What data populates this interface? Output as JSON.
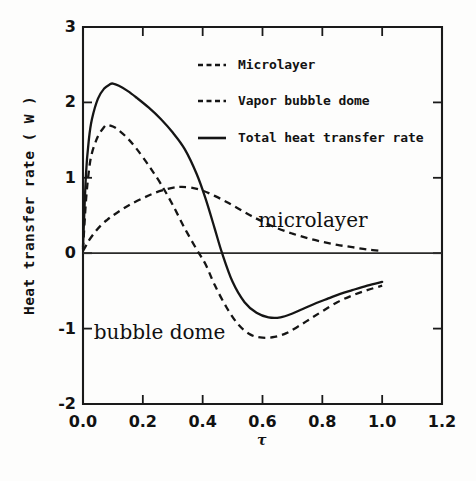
{
  "chart_data": {
    "type": "line",
    "title": "",
    "xlabel": "τ",
    "ylabel": "Heat transfer rate ( W )",
    "xlim": [
      0.0,
      1.2
    ],
    "ylim": [
      -2,
      3
    ],
    "xticks": [
      "0.0",
      "0.2",
      "0.4",
      "0.6",
      "0.8",
      "1.0",
      "1.2"
    ],
    "xtick_values": [
      0.0,
      0.2,
      0.4,
      0.6,
      0.8,
      1.0,
      1.2
    ],
    "yticks": [
      "3",
      "2",
      "1",
      "0",
      "-1",
      "-2"
    ],
    "ytick_values": [
      3,
      2,
      1,
      0,
      -1,
      -2
    ],
    "grid": false,
    "legend_position": "upper-center",
    "zero_reference_line": true,
    "series": [
      {
        "name": "Microlayer",
        "style": "dashed",
        "color": "#151515",
        "x": [
          0.0,
          0.01,
          0.02,
          0.04,
          0.06,
          0.08,
          0.1,
          0.13,
          0.16,
          0.2,
          0.24,
          0.28,
          0.31,
          0.33,
          0.36,
          0.4,
          0.44,
          0.48,
          0.52,
          0.56,
          0.6,
          0.65,
          0.7,
          0.75,
          0.8,
          0.85,
          0.9,
          0.95,
          1.0
        ],
        "y": [
          0.03,
          0.1,
          0.17,
          0.28,
          0.37,
          0.44,
          0.5,
          0.58,
          0.65,
          0.73,
          0.8,
          0.85,
          0.875,
          0.88,
          0.87,
          0.83,
          0.76,
          0.68,
          0.59,
          0.5,
          0.42,
          0.33,
          0.26,
          0.2,
          0.15,
          0.11,
          0.08,
          0.05,
          0.03
        ]
      },
      {
        "name": "Vapor bubble dome",
        "style": "dashed",
        "color": "#151515",
        "x": [
          0.0,
          0.01,
          0.02,
          0.03,
          0.05,
          0.07,
          0.08,
          0.1,
          0.12,
          0.15,
          0.18,
          0.22,
          0.26,
          0.3,
          0.34,
          0.38,
          0.41,
          0.44,
          0.48,
          0.52,
          0.56,
          0.6,
          0.64,
          0.68,
          0.72,
          0.76,
          0.8,
          0.85,
          0.9,
          0.95,
          1.0
        ],
        "y": [
          0.05,
          0.7,
          1.1,
          1.33,
          1.55,
          1.67,
          1.7,
          1.68,
          1.63,
          1.52,
          1.38,
          1.16,
          0.92,
          0.64,
          0.33,
          0.05,
          -0.15,
          -0.42,
          -0.72,
          -0.95,
          -1.08,
          -1.12,
          -1.11,
          -1.06,
          -0.97,
          -0.87,
          -0.77,
          -0.65,
          -0.56,
          -0.49,
          -0.43
        ]
      },
      {
        "name": "Total heat transfer rate",
        "style": "solid",
        "color": "#151515",
        "x": [
          0.0,
          0.01,
          0.02,
          0.03,
          0.05,
          0.07,
          0.09,
          0.1,
          0.12,
          0.15,
          0.18,
          0.22,
          0.26,
          0.3,
          0.34,
          0.38,
          0.41,
          0.44,
          0.465,
          0.5,
          0.54,
          0.58,
          0.62,
          0.66,
          0.7,
          0.74,
          0.78,
          0.82,
          0.86,
          0.9,
          0.95,
          1.0
        ],
        "y": [
          0.08,
          1.05,
          1.52,
          1.78,
          2.05,
          2.18,
          2.24,
          2.25,
          2.22,
          2.15,
          2.06,
          1.93,
          1.78,
          1.6,
          1.38,
          1.05,
          0.72,
          0.33,
          0.0,
          -0.38,
          -0.65,
          -0.79,
          -0.85,
          -0.85,
          -0.8,
          -0.73,
          -0.66,
          -0.6,
          -0.54,
          -0.49,
          -0.43,
          -0.38
        ]
      }
    ],
    "annotations": [
      {
        "text": "microlayer",
        "x": 0.77,
        "y": 0.42
      },
      {
        "text": "bubble dome",
        "x": 0.22,
        "y": -1.07
      }
    ]
  },
  "legend": {
    "entries": [
      {
        "label": "Microlayer",
        "style": "dashed"
      },
      {
        "label": "Vapor bubble dome",
        "style": "dashed"
      },
      {
        "label": "Total heat transfer rate",
        "style": "solid"
      }
    ]
  },
  "colors": {
    "ink": "#151515",
    "background": "#fdfdfc"
  }
}
